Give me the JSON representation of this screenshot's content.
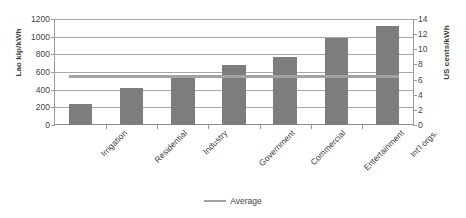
{
  "chart_data": {
    "type": "bar",
    "title": "",
    "xlabel": "",
    "ylabel": "Lao kip/kWh",
    "y2label": "US cents/kWh",
    "ylim": [
      0,
      1200
    ],
    "y2lim": [
      0,
      14
    ],
    "grid": true,
    "legend_position": "bottom",
    "categories": [
      "Irrigation",
      "Residential",
      "Industry",
      "Government",
      "Commercial",
      "Entertainment",
      "Int'l orgs."
    ],
    "series": [
      {
        "name": "Tariff",
        "unit": "Lao kip/kWh",
        "color": "#7d7d7d",
        "values": [
          240,
          420,
          565,
          685,
          775,
          990,
          1120
        ]
      },
      {
        "name": "Average",
        "type": "line",
        "unit": "Lao kip/kWh",
        "color": "#a3a3a3",
        "value": 545
      }
    ],
    "yticks": [
      0,
      200,
      400,
      600,
      800,
      1000,
      1200
    ],
    "y2ticks": [
      0,
      2,
      4,
      6,
      8,
      10,
      12,
      14
    ],
    "ytick_labels": [
      "0",
      "200",
      "400",
      "600",
      "800",
      "1000",
      "1200"
    ],
    "y2tick_labels": [
      "0",
      "2",
      "4",
      "6",
      "8",
      "10",
      "12",
      "14"
    ],
    "legend": [
      {
        "label": "Average",
        "color": "#a3a3a3",
        "marker": "line"
      }
    ]
  },
  "axes": {
    "left_title": "Lao kip/kWh",
    "right_title": "US cents/kWh"
  },
  "legend": {
    "average_label": "Average"
  }
}
